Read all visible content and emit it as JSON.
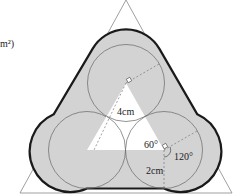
{
  "labels": {
    "unit_fragment": "m²)",
    "side_length": "4cm",
    "radius": "2cm",
    "angle_inner": "60°",
    "angle_outer": "120°"
  },
  "colors": {
    "shade": "#d3d3d3",
    "outline": "#1a1a1a",
    "thin_line": "#777777"
  }
}
